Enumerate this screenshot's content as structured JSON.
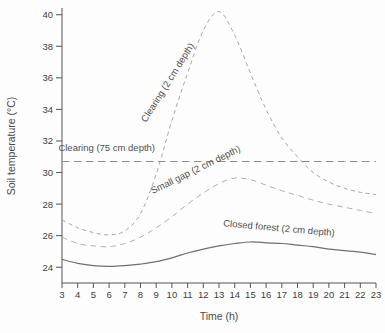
{
  "chart_data": {
    "type": "line",
    "title": "",
    "xlabel": "Time (h)",
    "ylabel": "Soil temperature (°C)",
    "xlim": [
      3,
      23
    ],
    "ylim": [
      23.0,
      40.3
    ],
    "xticks": [
      3,
      4,
      5,
      6,
      7,
      8,
      9,
      10,
      11,
      12,
      13,
      14,
      15,
      16,
      17,
      18,
      19,
      20,
      21,
      22,
      23
    ],
    "yticks": [
      24,
      26,
      28,
      30,
      32,
      34,
      36,
      38,
      40
    ],
    "grid": false,
    "legend_position": "inline-annotations",
    "x": [
      3,
      4,
      5,
      6,
      7,
      8,
      9,
      10,
      11,
      12,
      13,
      14,
      15,
      16,
      17,
      18,
      19,
      20,
      21,
      22,
      23
    ],
    "series": [
      {
        "name": "Clearing (2 cm depth)",
        "style": "dashed",
        "dash": "4 3.5",
        "color": "#a6a6a6",
        "width": 1,
        "values": [
          27.0,
          26.5,
          26.2,
          26.05,
          26.3,
          27.4,
          29.9,
          33.3,
          36.3,
          39.0,
          40.2,
          38.7,
          36.3,
          34.0,
          32.2,
          31.0,
          30.0,
          29.4,
          29.0,
          28.75,
          28.6
        ]
      },
      {
        "name": "Clearing (75 cm depth)",
        "style": "long-dash",
        "dash": "7.5 4.5",
        "color": "#8c8c8c",
        "width": 1,
        "values": [
          30.7,
          30.7,
          30.7,
          30.7,
          30.7,
          30.7,
          30.7,
          30.7,
          30.7,
          30.7,
          30.7,
          30.7,
          30.7,
          30.7,
          30.7,
          30.7,
          30.7,
          30.7,
          30.7,
          30.7,
          30.7
        ]
      },
      {
        "name": "Small gap (2 cm depth)",
        "style": "dashed",
        "dash": "5.5 4.5",
        "color": "#b0b0b0",
        "width": 1,
        "values": [
          25.9,
          25.5,
          25.35,
          25.3,
          25.5,
          25.9,
          26.5,
          27.2,
          28.0,
          28.7,
          29.3,
          29.65,
          29.55,
          29.2,
          28.85,
          28.55,
          28.25,
          28.0,
          27.8,
          27.6,
          27.4
        ]
      },
      {
        "name": "Closed forest (2 cm depth)",
        "style": "solid",
        "dash": "",
        "color": "#6f6f6f",
        "width": 1.2,
        "values": [
          24.5,
          24.25,
          24.1,
          24.05,
          24.1,
          24.2,
          24.35,
          24.6,
          24.9,
          25.15,
          25.35,
          25.5,
          25.6,
          25.55,
          25.5,
          25.4,
          25.3,
          25.15,
          25.05,
          24.95,
          24.8
        ]
      }
    ],
    "annotations": [
      {
        "text": "Clearing  (2 cm depth)",
        "x": 9.9,
        "y": 35.6,
        "rotate": -58
      },
      {
        "text": "Clearing  (75 cm depth)",
        "x": 5.85,
        "y": 31.35,
        "rotate": 0
      },
      {
        "text": "Small gap  (2 cm depth)",
        "x": 11.6,
        "y": 30.0,
        "rotate": -26
      },
      {
        "text": "Closed forest  (2 cm depth)",
        "x": 16.8,
        "y": 26.28,
        "rotate": 5
      }
    ],
    "axis_color": "#555555"
  }
}
